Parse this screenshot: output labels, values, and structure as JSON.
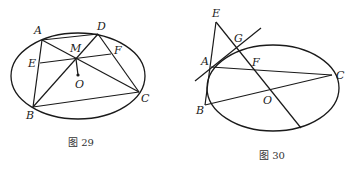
{
  "figures": [
    {
      "caption": "图 29",
      "labels": {
        "A": "A",
        "D": "D",
        "M": "M",
        "E": "E",
        "F": "F",
        "O": "O",
        "C": "C",
        "B": "B"
      }
    },
    {
      "caption": "图 30",
      "labels": {
        "E": "E",
        "G": "G",
        "A": "A",
        "F": "F",
        "C": "C",
        "O": "O",
        "B": "B"
      }
    }
  ],
  "colors": {
    "stroke": "#1a1a1a",
    "background": "#ffffff"
  }
}
